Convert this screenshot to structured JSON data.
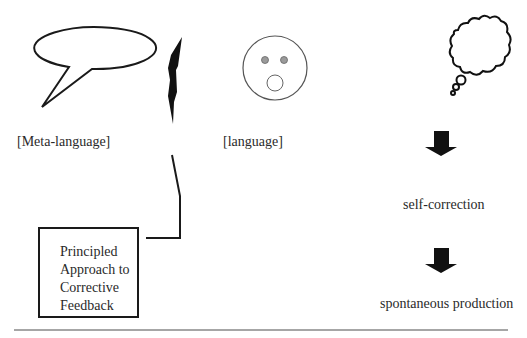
{
  "diagram": {
    "labels": {
      "meta_language": "[Meta-language]",
      "language": "[language]",
      "self_correction": "self-correction",
      "spontaneous_production": "spontaneous production"
    },
    "box": {
      "lines": [
        "Principled",
        "Approach to",
        "Corrective",
        "Feedback"
      ]
    },
    "icons": {
      "speech_bubble": "speech-bubble-icon",
      "lightning_bolt": "lightning-bolt-icon",
      "surprised_face": "surprised-face-icon",
      "thought_cloud": "thought-cloud-icon",
      "arrow_1": "down-arrow-icon",
      "arrow_2": "down-arrow-icon"
    },
    "colors": {
      "stroke": "#1a1a1a",
      "face_stroke": "#555555",
      "eye_fill": "#9a9a9a",
      "rule": "#888888"
    }
  }
}
